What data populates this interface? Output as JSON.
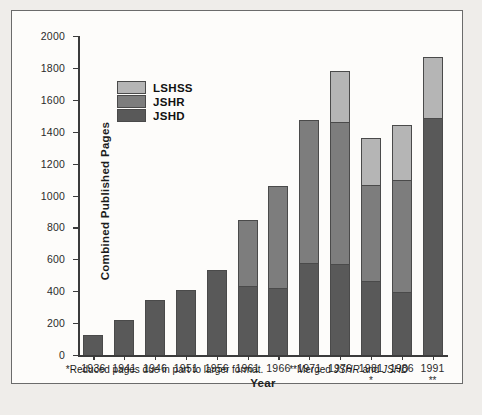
{
  "chart_data": {
    "type": "bar",
    "subtype": "stacked-bar",
    "title": "",
    "xlabel": "Year",
    "ylabel": "Combined Published Pages",
    "ylim": [
      0,
      2000
    ],
    "ytick_values": [
      0,
      200,
      400,
      600,
      800,
      1000,
      1200,
      1400,
      1600,
      1800,
      2000
    ],
    "ytick_labels": [
      "0",
      "200",
      "400",
      "600",
      "800",
      "1000",
      "1200",
      "1400",
      "1600",
      "1800",
      "2000"
    ],
    "grid": false,
    "legend_position": "upper-left-inside",
    "categories": [
      "1936",
      "1941",
      "1946",
      "1951",
      "1956",
      "1961",
      "1966",
      "1971",
      "1976",
      "1981",
      "1986",
      "1991"
    ],
    "category_notes": [
      "",
      "",
      "",
      "",
      "",
      "",
      "",
      "",
      "",
      "*",
      "",
      "**"
    ],
    "series": [
      {
        "name": "JSHD",
        "color": "#595959",
        "values": [
          125,
          220,
          345,
          410,
          530,
          435,
          420,
          580,
          570,
          465,
          395,
          1485
        ]
      },
      {
        "name": "JSHR",
        "color": "#7d7d7d",
        "values": [
          0,
          0,
          0,
          0,
          0,
          410,
          640,
          895,
          890,
          600,
          700,
          0
        ]
      },
      {
        "name": "LSHSS",
        "color": "#b5b5b5",
        "values": [
          0,
          0,
          0,
          0,
          0,
          0,
          0,
          0,
          320,
          295,
          350,
          385
        ]
      }
    ],
    "totals": [
      125,
      220,
      345,
      410,
      530,
      845,
      1060,
      1475,
      1780,
      1360,
      1445,
      1870
    ],
    "annotations": [
      "*Reduced pages due in part to larger format.",
      "**Merged JSHR and JSHD"
    ]
  },
  "legend": {
    "items": [
      {
        "label": "LSHSS",
        "color": "#b5b5b5"
      },
      {
        "label": "JSHR",
        "color": "#7d7d7d"
      },
      {
        "label": "JSHD",
        "color": "#595959"
      }
    ]
  },
  "footnotes": {
    "left_prefix": "*Reduced pages due in part to larger format.",
    "right_prefix": "**Merged ",
    "right_italic_1": "JSHR",
    "right_mid": " and ",
    "right_italic_2": "JSHD"
  }
}
